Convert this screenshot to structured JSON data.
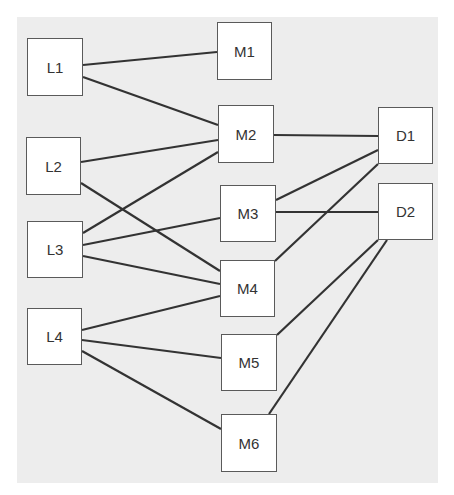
{
  "diagram": {
    "colors": {
      "background": "#ffffff",
      "panel": "#ededed",
      "node_fill": "#ffffff",
      "node_border": "#5a5a5a",
      "edge": "#333333",
      "text": "#333333"
    },
    "nodes": [
      {
        "id": "L1",
        "label": "L1",
        "x": 27,
        "y": 38,
        "w": 56,
        "h": 58
      },
      {
        "id": "L2",
        "label": "L2",
        "x": 26,
        "y": 137,
        "w": 55,
        "h": 58
      },
      {
        "id": "L3",
        "label": "L3",
        "x": 27,
        "y": 221,
        "w": 56,
        "h": 57
      },
      {
        "id": "L4",
        "label": "L4",
        "x": 27,
        "y": 308,
        "w": 55,
        "h": 57
      },
      {
        "id": "M1",
        "label": "M1",
        "x": 217,
        "y": 22,
        "w": 55,
        "h": 58
      },
      {
        "id": "M2",
        "label": "M2",
        "x": 218,
        "y": 105,
        "w": 56,
        "h": 58
      },
      {
        "id": "M3",
        "label": "M3",
        "x": 220,
        "y": 185,
        "w": 56,
        "h": 57
      },
      {
        "id": "M4",
        "label": "M4",
        "x": 220,
        "y": 260,
        "w": 55,
        "h": 57
      },
      {
        "id": "M5",
        "label": "M5",
        "x": 221,
        "y": 334,
        "w": 56,
        "h": 57
      },
      {
        "id": "M6",
        "label": "M6",
        "x": 221,
        "y": 414,
        "w": 56,
        "h": 58
      },
      {
        "id": "D1",
        "label": "D1",
        "x": 378,
        "y": 107,
        "w": 55,
        "h": 57
      },
      {
        "id": "D2",
        "label": "D2",
        "x": 378,
        "y": 183,
        "w": 55,
        "h": 57
      }
    ],
    "edges": [
      {
        "from": "L1",
        "to": "M1",
        "x1": 83,
        "y1": 65,
        "x2": 217,
        "y2": 52
      },
      {
        "from": "L1",
        "to": "M2",
        "x1": 83,
        "y1": 77,
        "x2": 218,
        "y2": 125
      },
      {
        "from": "L2",
        "to": "M2",
        "x1": 81,
        "y1": 162,
        "x2": 218,
        "y2": 140
      },
      {
        "from": "L2",
        "to": "M4",
        "x1": 81,
        "y1": 183,
        "x2": 220,
        "y2": 271
      },
      {
        "from": "L3",
        "to": "M2",
        "x1": 83,
        "y1": 233,
        "x2": 218,
        "y2": 152
      },
      {
        "from": "L3",
        "to": "M3",
        "x1": 83,
        "y1": 245,
        "x2": 220,
        "y2": 218
      },
      {
        "from": "L3",
        "to": "M4",
        "x1": 83,
        "y1": 256,
        "x2": 220,
        "y2": 284
      },
      {
        "from": "L4",
        "to": "M4",
        "x1": 82,
        "y1": 330,
        "x2": 220,
        "y2": 296
      },
      {
        "from": "L4",
        "to": "M5",
        "x1": 82,
        "y1": 340,
        "x2": 221,
        "y2": 358
      },
      {
        "from": "L4",
        "to": "M6",
        "x1": 82,
        "y1": 351,
        "x2": 221,
        "y2": 429
      },
      {
        "from": "M2",
        "to": "D1",
        "x1": 274,
        "y1": 135,
        "x2": 378,
        "y2": 136
      },
      {
        "from": "M3",
        "to": "D1",
        "x1": 276,
        "y1": 200,
        "x2": 378,
        "y2": 150
      },
      {
        "from": "M3",
        "to": "D2",
        "x1": 276,
        "y1": 212,
        "x2": 378,
        "y2": 212
      },
      {
        "from": "M4",
        "to": "D1",
        "x1": 275,
        "y1": 261,
        "x2": 378,
        "y2": 164
      },
      {
        "from": "M5",
        "to": "D2",
        "x1": 277,
        "y1": 335,
        "x2": 378,
        "y2": 240
      },
      {
        "from": "M6",
        "to": "D2",
        "x1": 269,
        "y1": 414,
        "x2": 387,
        "y2": 240
      }
    ]
  }
}
